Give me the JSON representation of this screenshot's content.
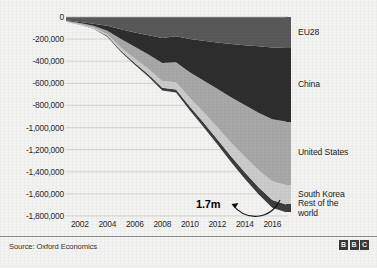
{
  "footer": {
    "source": "Source: Oxford Economics",
    "logo_letters": [
      "B",
      "B",
      "C"
    ]
  },
  "annotation": {
    "label": "1.7m"
  },
  "legend": {
    "items": [
      {
        "label": "EU28",
        "color": "#595959"
      },
      {
        "label": "China",
        "color": "#2e2e2e"
      },
      {
        "label": "United States",
        "color": "#a8a8a8"
      },
      {
        "label": "South Korea",
        "color": "#cbcbcb"
      },
      {
        "label": "Rest of the\nworld",
        "color": "#3d3d3d"
      }
    ]
  },
  "chart_data": {
    "type": "area",
    "title": "",
    "xlabel": "",
    "ylabel": "",
    "stacked": true,
    "grid": true,
    "legend_position": "right",
    "x": [
      2001,
      2002,
      2003,
      2004,
      2005,
      2006,
      2007,
      2008,
      2009,
      2010,
      2011,
      2012,
      2013,
      2014,
      2015,
      2016,
      2017
    ],
    "xticks": [
      2002,
      2004,
      2006,
      2008,
      2010,
      2012,
      2014,
      2016
    ],
    "xlim": [
      2001,
      2017
    ],
    "yticks": [
      0,
      -200000,
      -400000,
      -600000,
      -800000,
      -1000000,
      -1200000,
      -1400000,
      -1600000,
      -1800000
    ],
    "ytick_labels": [
      "0",
      "-200,000",
      "-400,000",
      "-600,000",
      "-800,000",
      "-1,000,000",
      "-1,200,000",
      "-1,400,000",
      "-1,600,000",
      "-1,800,000"
    ],
    "ylim": [
      -1800000,
      0
    ],
    "series": [
      {
        "name": "EU28",
        "color": "#595959",
        "values": [
          -30000,
          -45000,
          -60000,
          -80000,
          -110000,
          -140000,
          -165000,
          -190000,
          -175000,
          -200000,
          -215000,
          -230000,
          -245000,
          -255000,
          -265000,
          -275000,
          -280000
        ]
      },
      {
        "name": "China",
        "color": "#2e2e2e",
        "values": [
          -5000,
          -10000,
          -20000,
          -45000,
          -90000,
          -130000,
          -175000,
          -225000,
          -235000,
          -300000,
          -360000,
          -420000,
          -480000,
          -540000,
          -600000,
          -650000,
          -665000
        ]
      },
      {
        "name": "United States",
        "color": "#a8a8a8",
        "values": [
          -5000,
          -8000,
          -15000,
          -30000,
          -75000,
          -105000,
          -130000,
          -165000,
          -180000,
          -230000,
          -285000,
          -345000,
          -410000,
          -470000,
          -520000,
          -560000,
          -575000
        ]
      },
      {
        "name": "South Korea",
        "color": "#cbcbcb",
        "values": [
          -2000,
          -4000,
          -8000,
          -15000,
          -30000,
          -40000,
          -50000,
          -60000,
          -65000,
          -80000,
          -95000,
          -110000,
          -125000,
          -140000,
          -155000,
          -170000,
          -175000
        ]
      },
      {
        "name": "Rest of the world",
        "color": "#3d3d3d",
        "values": [
          -1000,
          -2000,
          -4000,
          -8000,
          -12000,
          -16000,
          -20000,
          -25000,
          -28000,
          -34000,
          -40000,
          -46000,
          -52000,
          -58000,
          -64000,
          -70000,
          -72000
        ]
      }
    ],
    "total_2016": -1725000,
    "annotation_value": "1.7m"
  }
}
